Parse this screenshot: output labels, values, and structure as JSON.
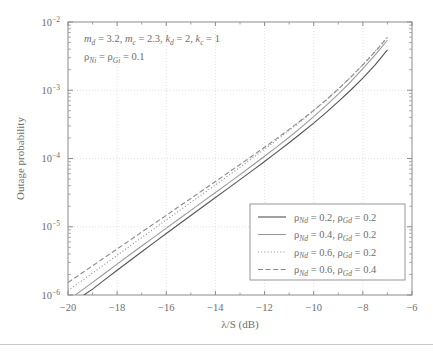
{
  "chart_data": {
    "type": "line",
    "title": "",
    "xlabel": "λ/S (dB)",
    "ylabel": "Outage probability",
    "xscale": "linear",
    "yscale": "log",
    "xlim": [
      -20,
      -6
    ],
    "ylim": [
      1e-06,
      0.01
    ],
    "xticks": [
      -20,
      -18,
      -16,
      -14,
      -12,
      -10,
      -8,
      -6
    ],
    "xticklabels": [
      "−20",
      "−18",
      "−16",
      "−14",
      "−12",
      "−10",
      "−8",
      "−6"
    ],
    "yticks": [
      1e-06,
      1e-05,
      0.0001,
      0.001,
      0.01
    ],
    "yticklabels": [
      "10−6",
      "10−5",
      "10−4",
      "10−3",
      "10−2"
    ],
    "grid": true,
    "grid_style": "dotted",
    "legend_position": "lower right",
    "annotations": [
      "m_d = 3.2, m_c = 2.3, k_d = 2, k_c = 1",
      "ρ_Ni = ρ_Gi = 0.1"
    ],
    "series": [
      {
        "name": "ρ_Nd = 0.2, ρ_Gd = 0.2",
        "style": "solid",
        "color": "#555555",
        "x": [
          -19.35,
          -19.0,
          -18.5,
          -18.0,
          -17.5,
          -17.0,
          -16.5,
          -16.0,
          -15.5,
          -15.0,
          -14.5,
          -14.0,
          -13.5,
          -13.0,
          -12.5,
          -12.0,
          -11.5,
          -11.0,
          -10.5,
          -10.0,
          -9.5,
          -9.0,
          -8.5,
          -8.0,
          -7.5,
          -7.0
        ],
        "y": [
          1e-06,
          1.22e-06,
          1.68e-06,
          2.3e-06,
          3.15e-06,
          4.3e-06,
          5.85e-06,
          7.95e-06,
          1.08e-05,
          1.46e-05,
          1.98e-05,
          2.68e-05,
          3.62e-05,
          4.9e-05,
          6.65e-05,
          9.05e-05,
          0.000124,
          0.00017,
          0.000236,
          0.00033,
          0.00047,
          0.00068,
          0.001,
          0.0015,
          0.00235,
          0.0039
        ]
      },
      {
        "name": "ρ_Nd = 0.4, ρ_Gd = 0.2",
        "style": "solid",
        "color": "#9a9a9a",
        "x": [
          -19.7,
          -19.5,
          -19.0,
          -18.5,
          -18.0,
          -17.5,
          -17.0,
          -16.5,
          -16.0,
          -15.5,
          -15.0,
          -14.5,
          -14.0,
          -13.5,
          -13.0,
          -12.5,
          -12.0,
          -11.5,
          -11.0,
          -10.5,
          -10.0,
          -9.5,
          -9.0,
          -8.5,
          -8.0,
          -7.5,
          -7.0
        ],
        "y": [
          1e-06,
          1.13e-06,
          1.53e-06,
          2.08e-06,
          2.83e-06,
          3.85e-06,
          5.22e-06,
          7.06e-06,
          9.55e-06,
          1.29e-05,
          1.74e-05,
          2.35e-05,
          3.17e-05,
          4.28e-05,
          5.8e-05,
          7.88e-05,
          0.000108,
          0.000148,
          0.000205,
          0.000288,
          0.00041,
          0.000595,
          0.00088,
          0.00133,
          0.00208,
          0.0033,
          0.0054
        ]
      },
      {
        "name": "ρ_Nd = 0.6, ρ_Gd = 0.2",
        "style": "dotted",
        "color": "#8a8a8a",
        "x": [
          -20.0,
          -19.5,
          -19.0,
          -18.5,
          -18.0,
          -17.5,
          -17.0,
          -16.5,
          -16.0,
          -15.5,
          -15.0,
          -14.5,
          -14.0,
          -13.5,
          -13.0,
          -12.5,
          -12.0,
          -11.5,
          -11.0,
          -10.5,
          -10.0,
          -9.5,
          -9.0,
          -8.5,
          -8.0,
          -7.5,
          -7.0
        ],
        "y": [
          1.16e-06,
          1.56e-06,
          2.1e-06,
          2.83e-06,
          3.82e-06,
          5.15e-06,
          6.95e-06,
          9.35e-06,
          1.26e-05,
          1.69e-05,
          2.27e-05,
          3.05e-05,
          4.1e-05,
          5.52e-05,
          7.45e-05,
          0.000101,
          0.000137,
          0.000187,
          0.000257,
          0.000356,
          0.0005,
          0.000715,
          0.00104,
          0.00155,
          0.00238,
          0.00372,
          0.006
        ]
      },
      {
        "name": "ρ_Nd = 0.6, ρ_Gd = 0.4",
        "style": "dashed",
        "color": "#8a8a8a",
        "x": [
          -20.0,
          -19.5,
          -19.0,
          -18.5,
          -18.0,
          -17.5,
          -17.0,
          -16.5,
          -16.0,
          -15.5,
          -15.0,
          -14.5,
          -14.0,
          -13.5,
          -13.0,
          -12.5,
          -12.0,
          -11.5,
          -11.0,
          -10.5,
          -10.0,
          -9.5,
          -9.0,
          -8.5,
          -8.0,
          -7.5,
          -7.0
        ],
        "y": [
          1.52e-06,
          2.02e-06,
          2.68e-06,
          3.56e-06,
          4.73e-06,
          6.28e-06,
          8.35e-06,
          1.11e-05,
          1.47e-05,
          1.96e-05,
          2.6e-05,
          3.46e-05,
          4.6e-05,
          6.13e-05,
          8.18e-05,
          0.000109,
          0.000146,
          0.000197,
          0.000267,
          0.000366,
          0.000508,
          0.000718,
          0.00104,
          0.00154,
          0.00235,
          0.00368,
          0.00595
        ]
      }
    ]
  },
  "axis": {
    "xlabel": "λ/S (dB)",
    "ylabel": "Outage probability"
  },
  "annotation": {
    "line1": {
      "m_d_sym": "m",
      "m_d_sub": "d",
      "m_d_val": "= 3.2,",
      "m_c_sym": "m",
      "m_c_sub": "c",
      "m_c_val": "= 2.3,",
      "k_d_sym": "k",
      "k_d_sub": "d",
      "k_d_val": "= 2,",
      "k_c_sym": "k",
      "k_c_sub": "c",
      "k_c_val": "= 1"
    },
    "line2": {
      "rho_N_sym": "ρ",
      "rho_N_sub": "Ni",
      "eq": "=",
      "rho_G_sym": "ρ",
      "rho_G_sub": "Gi",
      "val": "= 0.1"
    }
  },
  "legend": {
    "entries": [
      {
        "rho_n_sym": "ρ",
        "rho_n_sub": "Nd",
        "rho_n_val": "= 0.2,",
        "rho_g_sym": "ρ",
        "rho_g_sub": "Gd",
        "rho_g_val": "= 0.2"
      },
      {
        "rho_n_sym": "ρ",
        "rho_n_sub": "Nd",
        "rho_n_val": "= 0.4,",
        "rho_g_sym": "ρ",
        "rho_g_sub": "Gd",
        "rho_g_val": "= 0.2"
      },
      {
        "rho_n_sym": "ρ",
        "rho_n_sub": "Nd",
        "rho_n_val": "= 0.6,",
        "rho_g_sym": "ρ",
        "rho_g_sub": "Gd",
        "rho_g_val": "= 0.2"
      },
      {
        "rho_n_sym": "ρ",
        "rho_n_sub": "Nd",
        "rho_n_val": "= 0.6,",
        "rho_g_sym": "ρ",
        "rho_g_sub": "Gd",
        "rho_g_val": "= 0.4"
      }
    ]
  }
}
